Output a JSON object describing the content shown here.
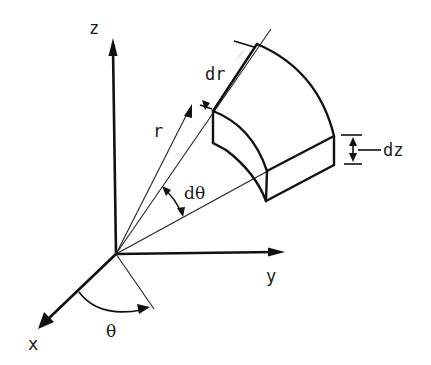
{
  "figure": {
    "axes": {
      "z_label": "z",
      "y_label": "y",
      "x_label": "x"
    },
    "labels": {
      "r": "r",
      "dr": "dr",
      "dz": "dz",
      "dtheta": "dθ",
      "theta": "θ"
    },
    "colors": {
      "line": "#111111",
      "background": "#ffffff"
    }
  }
}
